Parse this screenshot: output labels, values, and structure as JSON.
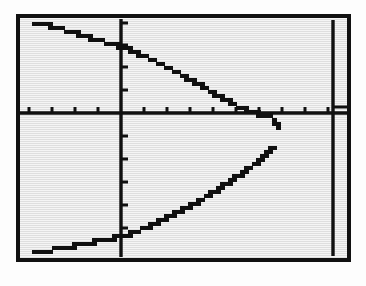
{
  "device": {
    "kind": "graphing-calculator-screen",
    "screen_background": "#e9e9e9",
    "ink_color": "#101010",
    "frame_color": "#111111"
  },
  "chart_data": {
    "type": "line",
    "title": "",
    "subtitle": "",
    "xlabel": "",
    "ylabel": "",
    "grid": false,
    "legend": null,
    "axes": {
      "x_axis_visible": true,
      "y_axis_visible": true,
      "origin_px": [
        119,
        113
      ],
      "tick_spacing_px": 23,
      "x_tick_count_left": 4,
      "x_tick_count_right": 9,
      "y_tick_count_up": 4,
      "y_tick_count_down": 5,
      "xlim": [
        -4.4,
        10.0
      ],
      "ylim": [
        -6.5,
        4.3
      ],
      "xticks": [
        -4,
        -3,
        -2,
        -1,
        1,
        2,
        3,
        4,
        5,
        6,
        7,
        8,
        9
      ],
      "yticks": [
        -5,
        -4,
        -3,
        -2,
        -1,
        1,
        2,
        3,
        4
      ]
    },
    "extra_lines": [
      {
        "name": "vertical-line",
        "orientation": "vertical",
        "x_value": 9.2,
        "x_px": 331,
        "y_from_px": 20,
        "y_to_px": 256,
        "description": "vertical line drawn near right edge of screen"
      }
    ],
    "series": [
      {
        "name": "upper-branch",
        "description": "upper half of a rightward-opening sideways parabola, decreasing from top-left to the vertex",
        "style": "pixelated-staircase",
        "points_px": [
          [
            30,
            21
          ],
          [
            40,
            23
          ],
          [
            50,
            25
          ],
          [
            60,
            28
          ],
          [
            70,
            31
          ],
          [
            80,
            34
          ],
          [
            90,
            37
          ],
          [
            100,
            40
          ],
          [
            110,
            43
          ],
          [
            119,
            46
          ],
          [
            130,
            50
          ],
          [
            142,
            55
          ],
          [
            154,
            61
          ],
          [
            166,
            67
          ],
          [
            178,
            73
          ],
          [
            190,
            80
          ],
          [
            202,
            87
          ],
          [
            214,
            94
          ],
          [
            226,
            101
          ],
          [
            238,
            107
          ],
          [
            248,
            111
          ],
          [
            258,
            113
          ],
          [
            266,
            115
          ],
          [
            271,
            118
          ],
          [
            273,
            124
          ]
        ]
      },
      {
        "name": "lower-branch",
        "description": "lower half of the same sideways parabola, increasing from bottom-left to the vertex",
        "style": "pixelated-staircase",
        "points_px": [
          [
            31,
            251
          ],
          [
            42,
            249
          ],
          [
            53,
            247
          ],
          [
            64,
            245
          ],
          [
            75,
            243
          ],
          [
            86,
            241
          ],
          [
            97,
            238
          ],
          [
            108,
            236
          ],
          [
            119,
            234
          ],
          [
            131,
            230
          ],
          [
            143,
            225
          ],
          [
            155,
            220
          ],
          [
            167,
            214
          ],
          [
            179,
            208
          ],
          [
            191,
            201
          ],
          [
            203,
            194
          ],
          [
            215,
            186
          ],
          [
            227,
            178
          ],
          [
            239,
            170
          ],
          [
            249,
            163
          ],
          [
            258,
            156
          ],
          [
            264,
            151
          ],
          [
            268,
            147
          ]
        ]
      }
    ],
    "annotations": [
      {
        "name": "vertex-gap",
        "text": "",
        "description": "small pixel gap between the two branches at the parabola vertex near x=272"
      }
    ]
  }
}
